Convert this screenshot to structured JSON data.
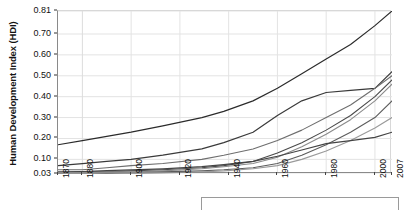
{
  "chart_data": {
    "type": "line",
    "title": "",
    "xlabel": "",
    "ylabel": "Human Development Index (HDI)",
    "xlim": [
      1870,
      2007
    ],
    "ylim": [
      0.03,
      0.81
    ],
    "grid": true,
    "legend_position": "bottom",
    "xticks": [
      1870,
      1880,
      1900,
      1920,
      1940,
      1960,
      1980,
      2000,
      2007
    ],
    "xtick_labels": [
      "1870",
      "1880",
      "1900",
      "1920",
      "1940",
      "1960",
      "1980",
      "2000",
      "2007"
    ],
    "yticks": [
      0.03,
      0.1,
      0.2,
      0.3,
      0.4,
      0.5,
      0.6,
      0.7,
      0.81
    ],
    "ytick_labels": [
      "0.03",
      "0.10",
      "0.20",
      "0.30",
      "0.40",
      "0.50",
      "0.60",
      "0.70",
      "0.81"
    ],
    "x": [
      1870,
      1880,
      1890,
      1900,
      1913,
      1929,
      1938,
      1950,
      1960,
      1970,
      1980,
      1990,
      2000,
      2007
    ],
    "series": [
      {
        "name": "Western Europe and Offshoots",
        "color": "#2b2b2b",
        "width": 1.2,
        "values": [
          0.17,
          0.19,
          0.21,
          0.23,
          0.26,
          0.3,
          0.33,
          0.38,
          0.44,
          0.51,
          0.58,
          0.65,
          0.74,
          0.81
        ]
      },
      {
        "name": "Eastern Europe",
        "color": "#3a3a3a",
        "width": 1.2,
        "values": [
          0.07,
          0.08,
          0.09,
          0.1,
          0.12,
          0.15,
          0.18,
          0.23,
          0.31,
          0.38,
          0.42,
          0.43,
          0.44,
          0.52
        ]
      },
      {
        "name": "Latin America",
        "color": "#6e6e6e",
        "width": 1.1,
        "values": [
          0.05,
          0.05,
          0.06,
          0.07,
          0.08,
          0.1,
          0.12,
          0.15,
          0.19,
          0.24,
          0.3,
          0.36,
          0.44,
          0.5
        ]
      },
      {
        "name": "East Asia",
        "color": "#4a4a4a",
        "width": 1.1,
        "values": [
          0.035,
          0.04,
          0.04,
          0.045,
          0.05,
          0.06,
          0.07,
          0.09,
          0.13,
          0.18,
          0.24,
          0.31,
          0.4,
          0.48
        ]
      },
      {
        "name": "Middle East and North Africa",
        "color": "#8a8a8a",
        "width": 1.1,
        "values": [
          0.035,
          0.035,
          0.04,
          0.04,
          0.045,
          0.055,
          0.065,
          0.08,
          0.11,
          0.16,
          0.22,
          0.29,
          0.38,
          0.46
        ]
      },
      {
        "name": "South Asia",
        "color": "#5c5c5c",
        "width": 1.1,
        "values": [
          0.03,
          0.03,
          0.032,
          0.035,
          0.04,
          0.045,
          0.05,
          0.06,
          0.08,
          0.12,
          0.17,
          0.23,
          0.3,
          0.38
        ]
      },
      {
        "name": "Sub-Saharan Africa",
        "color": "#9a9a9a",
        "width": 1.1,
        "values": [
          0.03,
          0.03,
          0.03,
          0.032,
          0.035,
          0.04,
          0.045,
          0.055,
          0.07,
          0.1,
          0.14,
          0.19,
          0.25,
          0.3
        ]
      },
      {
        "name": "World",
        "color": "#444444",
        "width": 1.2,
        "values": [
          0.04,
          0.042,
          0.046,
          0.05,
          0.055,
          0.065,
          0.075,
          0.09,
          0.115,
          0.145,
          0.175,
          0.19,
          0.205,
          0.23
        ]
      }
    ]
  }
}
